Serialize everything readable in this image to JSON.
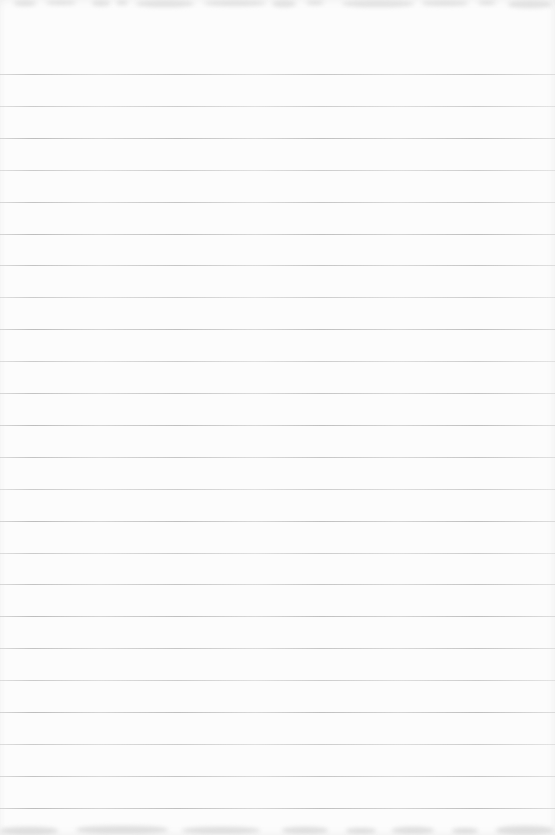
{
  "page": {
    "kind": "blank-ruled-notebook-page-scan",
    "width_px": 555,
    "height_px": 835,
    "paper_color": "#fcfcfc",
    "text_content": ""
  },
  "ruling": {
    "line_count": 24,
    "first_line_y_px": 74,
    "line_spacing_px": 31.9,
    "line_thickness_px": 1,
    "line_color": "#a9a9a9",
    "full_bleed": true
  },
  "artifacts": {
    "top_edge": {
      "description": "faint illegible ink show-through, cropped at top edge",
      "color": "#e2e2e2",
      "patches": [
        {
          "x": 14,
          "y": 0,
          "w": 22,
          "h": 6
        },
        {
          "x": 46,
          "y": 0,
          "w": 30,
          "h": 5
        },
        {
          "x": 92,
          "y": 0,
          "w": 18,
          "h": 6
        },
        {
          "x": 116,
          "y": 0,
          "w": 12,
          "h": 5
        },
        {
          "x": 136,
          "y": 0,
          "w": 58,
          "h": 7
        },
        {
          "x": 204,
          "y": 0,
          "w": 62,
          "h": 6
        },
        {
          "x": 272,
          "y": 0,
          "w": 24,
          "h": 7
        },
        {
          "x": 306,
          "y": 0,
          "w": 18,
          "h": 5
        },
        {
          "x": 342,
          "y": 0,
          "w": 72,
          "h": 7
        },
        {
          "x": 422,
          "y": 0,
          "w": 46,
          "h": 6
        },
        {
          "x": 478,
          "y": 0,
          "w": 18,
          "h": 5
        },
        {
          "x": 508,
          "y": 0,
          "w": 44,
          "h": 8
        }
      ]
    },
    "bottom_edge": {
      "description": "faint illegible ink show-through, cropped at bottom edge",
      "color": "#dedede",
      "patches": [
        {
          "x": 0,
          "y": 6,
          "w": 58,
          "h": 8
        },
        {
          "x": 76,
          "y": 5,
          "w": 92,
          "h": 8
        },
        {
          "x": 182,
          "y": 6,
          "w": 78,
          "h": 7
        },
        {
          "x": 282,
          "y": 6,
          "w": 46,
          "h": 7
        },
        {
          "x": 346,
          "y": 7,
          "w": 30,
          "h": 6
        },
        {
          "x": 392,
          "y": 6,
          "w": 42,
          "h": 7
        },
        {
          "x": 452,
          "y": 7,
          "w": 26,
          "h": 6
        },
        {
          "x": 496,
          "y": 5,
          "w": 58,
          "h": 9
        }
      ]
    }
  }
}
